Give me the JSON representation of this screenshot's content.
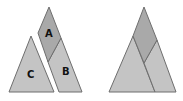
{
  "diagram": {
    "left_figure": {
      "pieces": [
        {
          "id": "A",
          "label": "A",
          "fill": "#a9a9a9"
        },
        {
          "id": "B",
          "label": "B",
          "fill": "#c4c4c4"
        },
        {
          "id": "C",
          "label": "C",
          "fill": "#c4c4c4"
        }
      ]
    },
    "right_figure": {
      "description": "Pieces A, B and C assembled into one large triangle",
      "fills": {
        "top": "#a9a9a9",
        "sides": "#c4c4c4"
      }
    },
    "outline_color": "#6e6e6e"
  }
}
